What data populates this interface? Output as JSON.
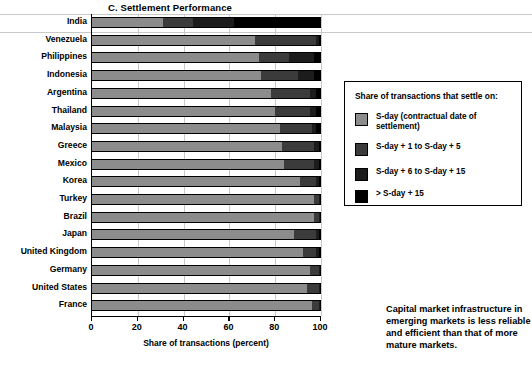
{
  "chart_data": {
    "type": "bar",
    "orientation": "horizontal",
    "stacked": true,
    "title": "C. Settlement Performance",
    "xlabel": "Share of transactions (percent)",
    "ylabel": "",
    "xlim": [
      0,
      100
    ],
    "xticks": [
      0,
      20,
      40,
      60,
      80,
      100
    ],
    "grid": true,
    "legend_position": "right",
    "legend_title": "Share of transactions that settle on:",
    "categories": [
      "India",
      "Venezuela",
      "Philippines",
      "Indonesia",
      "Argentina",
      "Thailand",
      "Malaysia",
      "Greece",
      "Mexico",
      "Korea",
      "Turkey",
      "Brazil",
      "Japan",
      "United Kingdom",
      "Germany",
      "United States",
      "France"
    ],
    "series": [
      {
        "name": "S-day (contractual date of settlement)",
        "color": "#8c8c8c",
        "values": [
          31,
          71,
          73,
          74,
          78,
          80,
          82,
          83,
          84,
          91,
          97,
          97,
          88,
          92,
          95,
          94,
          96
        ]
      },
      {
        "name": "S-day + 1 to S-day + 5",
        "color": "#3b3b3b",
        "values": [
          13,
          27,
          13,
          16,
          17,
          15,
          14,
          14,
          13,
          7,
          2,
          2,
          10,
          6,
          4,
          5,
          3
        ]
      },
      {
        "name": "S-day + 6 to S-day + 15",
        "color": "#1c1c1c",
        "values": [
          18,
          1,
          11,
          7,
          3,
          3,
          2,
          2,
          2,
          1,
          0.5,
          0.5,
          1,
          1,
          0.5,
          0.5,
          0.5
        ]
      },
      {
        "name": "> S-day + 15",
        "color": "#000000",
        "values": [
          38,
          1,
          3,
          3,
          2,
          2,
          2,
          1,
          1,
          1,
          0.5,
          0.5,
          1,
          1,
          0.5,
          0.5,
          0.5
        ]
      }
    ]
  },
  "legend": {
    "title": "Share of transactions that settle on:",
    "items": [
      {
        "label": "S-day (contractual date of settlement)",
        "swatch": "s0"
      },
      {
        "label": "S-day + 1 to S-day + 5",
        "swatch": "s1"
      },
      {
        "label": "S-day + 6 to S-day + 15",
        "swatch": "s2"
      },
      {
        "label": "> S-day + 15",
        "swatch": "s3"
      }
    ]
  },
  "caption": {
    "text": "Capital market infrastructure in emerging markets is less reliable and efficient than that of more mature markets."
  }
}
